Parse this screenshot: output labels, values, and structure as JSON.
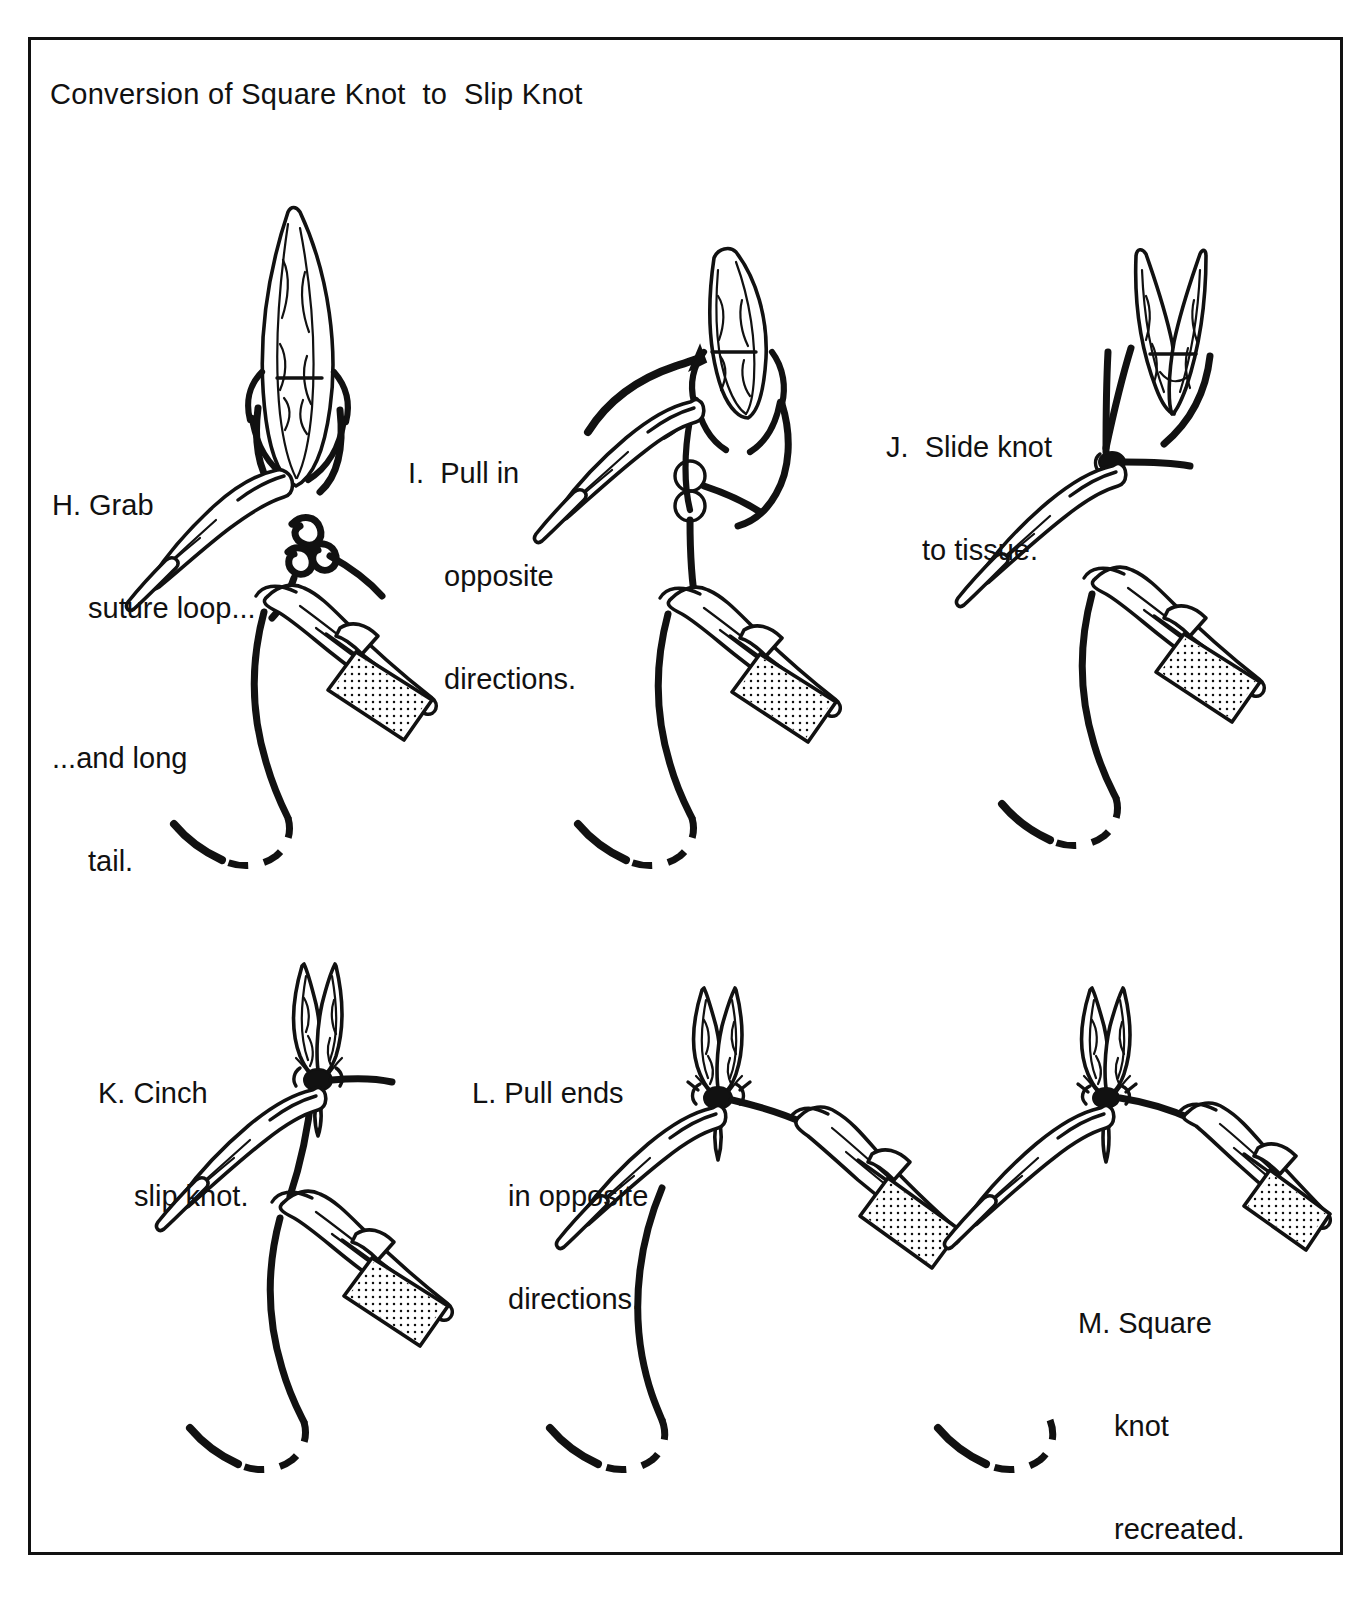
{
  "figure": {
    "title": "Conversion of Square Knot  to  Slip Knot",
    "domain_kind": "surgical technique line-art diagram",
    "background_color": "#ffffff",
    "ink_color": "#111111",
    "border_color": "#111111"
  },
  "panels": [
    {
      "id": "H",
      "letter": "H.",
      "caption_lines": [
        "H. Grab",
        "suture loop..."
      ],
      "caption_secondary_lines": [
        "...and long",
        "tail."
      ],
      "caption_text": "H. Grab suture loop... ...and long tail.",
      "elements": [
        "tissue-wound",
        "forceps",
        "needle-holder",
        "square-knot",
        "suture-loop",
        "suture-tail"
      ]
    },
    {
      "id": "I",
      "letter": "I.",
      "caption_lines": [
        "I.  Pull in",
        "opposite",
        "directions."
      ],
      "caption_text": "I. Pull in opposite directions.",
      "elements": [
        "tissue-wound",
        "forceps",
        "needle-holder",
        "loosened-knot",
        "arrow",
        "suture-tail"
      ]
    },
    {
      "id": "J",
      "letter": "J.",
      "caption_lines": [
        "J.  Slide knot",
        "to tissue."
      ],
      "caption_text": "J. Slide knot to tissue.",
      "elements": [
        "tissue-wound",
        "forceps",
        "needle-holder",
        "slip-knot",
        "suture-tail"
      ]
    },
    {
      "id": "K",
      "letter": "K.",
      "caption_lines": [
        "K. Cinch",
        "slip knot."
      ],
      "caption_text": "K. Cinch slip knot.",
      "elements": [
        "tissue-wound-closed",
        "forceps",
        "needle-holder",
        "slip-knot",
        "suture-tail"
      ]
    },
    {
      "id": "L",
      "letter": "L.",
      "caption_lines": [
        "L. Pull ends",
        "in opposite",
        "directions."
      ],
      "caption_text": "L. Pull ends in opposite directions.",
      "elements": [
        "tissue-wound-closed",
        "forceps",
        "needle-holder",
        "knot",
        "suture-tail"
      ]
    },
    {
      "id": "M",
      "letter": "M.",
      "caption_lines": [
        "M. Square",
        "knot",
        "recreated."
      ],
      "caption_text": "M. Square knot recreated.",
      "elements": [
        "tissue-wound-closed",
        "forceps",
        "needle-holder",
        "square-knot",
        "suture-tail"
      ]
    }
  ]
}
